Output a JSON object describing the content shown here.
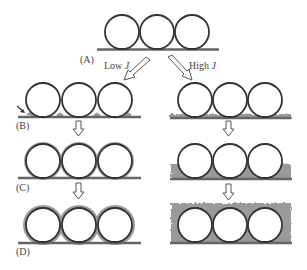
{
  "diagram": {
    "colors": {
      "circle_stroke": "#333333",
      "substrate": "#666666",
      "deposit": "#9a9a9a",
      "arrow_stroke": "#555555"
    },
    "labels": {
      "A": "(A)",
      "B": "(B)",
      "C": "(C)",
      "D": "(D)",
      "low_prefix": "Low ",
      "low_var": "J",
      "high_prefix": "High ",
      "high_var": "J"
    },
    "stages": [
      {
        "id": "A",
        "description": "Three spheres resting on substrate"
      },
      {
        "id": "B",
        "branch": "low",
        "description": "Deposit nucleates at sphere-substrate contact points"
      },
      {
        "id": "B",
        "branch": "high",
        "description": "Thin uniform deposit layer over substrate"
      },
      {
        "id": "C",
        "branch": "low",
        "description": "Deposit grows conformally around spheres"
      },
      {
        "id": "C",
        "branch": "high",
        "description": "Rough deposit fills lower half between spheres"
      },
      {
        "id": "D",
        "branch": "low",
        "description": "Thin conformal shell coats spheres"
      },
      {
        "id": "D",
        "branch": "high",
        "description": "Rough deposit fully buries spheres"
      }
    ]
  }
}
